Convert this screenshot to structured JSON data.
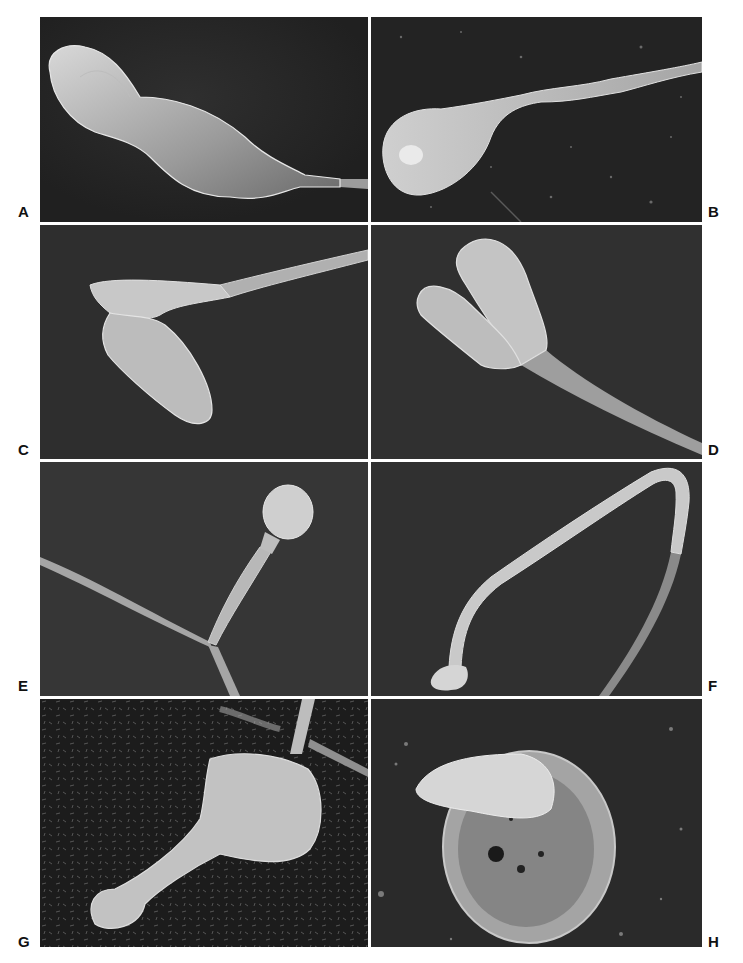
{
  "page": {
    "running_head": "",
    "background": "#ffffff"
  },
  "figure": {
    "type": "scanning electron micrograph plate",
    "layout": {
      "rows": 4,
      "columns": 2
    },
    "panels": [
      {
        "label": "A",
        "position": "row1-left",
        "label_side": "left",
        "subject": "abnormal sperm with elongated, constricted head and thin tail to the right",
        "background": "#2a2a2a"
      },
      {
        "label": "B",
        "position": "row1-right",
        "label_side": "right",
        "subject": "sperm with round head bearing surface debris and tapering midpiece to upper right",
        "background": "#232323"
      },
      {
        "label": "C",
        "position": "row2-left",
        "label_side": "left",
        "subject": "sperm with bent head folded back at the neck, tail extending to upper right",
        "background": "#2e2e2e"
      },
      {
        "label": "D",
        "position": "row2-right",
        "label_side": "right",
        "subject": "bicephalic (two-headed) sperm merging into single tail toward lower right",
        "background": "#303030"
      },
      {
        "label": "E",
        "position": "row3-left",
        "label_side": "left",
        "subject": "small round-headed sperm with irregular midpiece, tail forming Y-junction with another tail",
        "background": "#363636"
      },
      {
        "label": "F",
        "position": "row3-right",
        "label_side": "right",
        "subject": "looped tail folding back on itself with small detached head fragment at lower left",
        "background": "#303030"
      },
      {
        "label": "G",
        "position": "row4-left",
        "label_side": "left",
        "subject": "swollen head with club-shaped extension on granular background, tail at top",
        "background": "#1c1c1c"
      },
      {
        "label": "H",
        "position": "row4-right",
        "label_side": "right",
        "subject": "pointed head resting on a round disc-like membranous structure with pores",
        "background": "#2a2a2a"
      }
    ]
  }
}
